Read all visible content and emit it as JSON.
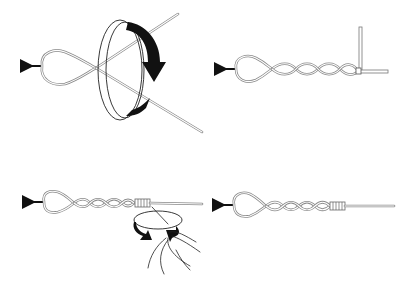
{
  "diagram": {
    "title": "",
    "panels": [
      {
        "id": "step-1",
        "description": "Loop held on hook/arrow with tag end; rotating band arrow indicates twisting motion"
      },
      {
        "id": "step-2",
        "description": "Loop with four twists; tag end bent at right angle to standing line"
      },
      {
        "id": "step-3",
        "description": "Twisted loop with wraps being made at end; hand rotating with curved arrows"
      },
      {
        "id": "step-4",
        "description": "Finished knot: loop, four twists, wrapped collar, standing line"
      }
    ],
    "colors": {
      "line": "#8a8a8a",
      "ink": "#111111",
      "background": "#ffffff"
    }
  }
}
